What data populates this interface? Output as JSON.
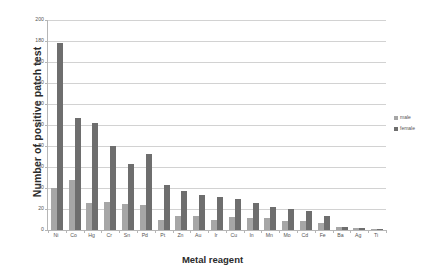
{
  "chart_data": {
    "type": "bar",
    "title": "",
    "xlabel": "Metal reagent",
    "ylabel": "Number of positive patch test",
    "ylim": [
      0,
      200
    ],
    "yticks": [
      0,
      20,
      40,
      60,
      80,
      100,
      120,
      140,
      160,
      180,
      200
    ],
    "grid": true,
    "legend_position": "right",
    "categories": [
      "Ni",
      "Co",
      "Hg",
      "Cr",
      "Sn",
      "Pd",
      "Pt",
      "Zn",
      "Au",
      "Ir",
      "Cu",
      "In",
      "Mn",
      "Mo",
      "Cd",
      "Fe",
      "Ba",
      "Ag",
      "Ti"
    ],
    "series": [
      {
        "name": "male",
        "color": "#a6a6a6",
        "values": [
          40,
          48,
          26,
          27,
          25,
          24,
          10,
          13,
          13,
          10,
          12,
          11,
          11,
          9,
          9,
          7,
          3,
          2,
          1
        ]
      },
      {
        "name": "female",
        "color": "#6e6e6e",
        "values": [
          178,
          107,
          102,
          80,
          63,
          72,
          43,
          37,
          33,
          31,
          30,
          26,
          22,
          20,
          18,
          13,
          3,
          2,
          1
        ]
      }
    ]
  },
  "legend": {
    "items": [
      {
        "label": "male"
      },
      {
        "label": "female"
      }
    ]
  },
  "colors": {
    "male": "#a6a6a6",
    "female": "#6e6e6e",
    "gridline": "#d2d2d2",
    "axis": "#b6b6b6",
    "text": "#555555",
    "title_text": "#2b2b2b",
    "background": "#ffffff"
  }
}
